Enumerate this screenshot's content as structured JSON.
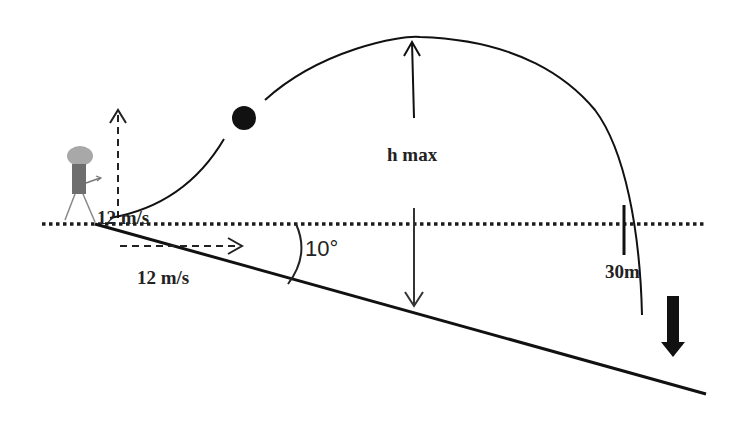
{
  "diagram": {
    "labels": {
      "vertical_velocity": "12 m/s",
      "horizontal_velocity": "12 m/s",
      "max_height": "h max",
      "angle": "10°",
      "distance": "30m"
    },
    "colors": {
      "line": "#1a1a1a",
      "ball": "#111111",
      "person_head": "#a8a8a8",
      "person_body": "#6e6e6e",
      "background": "#ffffff"
    },
    "elements": [
      "person",
      "horizontal-reference-line",
      "incline-surface",
      "trajectory",
      "ball",
      "vertical-velocity-arrow",
      "horizontal-velocity-arrow",
      "hmax-arrows",
      "angle-arc",
      "distance-marker",
      "down-arrow"
    ]
  }
}
